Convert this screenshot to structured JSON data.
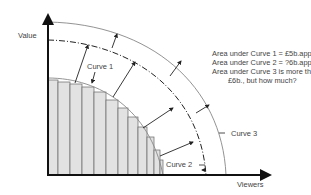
{
  "diagram": {
    "axes": {
      "y_label": "Value",
      "x_label": "Viewers"
    },
    "curves": [
      {
        "label": "Curve 1",
        "style": "solid-thin"
      },
      {
        "label": "Curve 2",
        "style": "dash-dot"
      },
      {
        "label": "Curve 3",
        "style": "solid-thin"
      }
    ],
    "annotation": {
      "line1": "Area under Curve 1 = £5b.approx",
      "line2": "Area under Curve 2 = ?6b.approx",
      "line3": "Area under Curve 3 is more than",
      "line4": "£6b., but how much?"
    },
    "bars": {
      "count": 12,
      "fill": "#e2e2e2",
      "stroke": "#555555"
    },
    "colors": {
      "axis": "#111111",
      "curve": "#777777",
      "arrow": "#222222",
      "text": "#444444"
    }
  }
}
